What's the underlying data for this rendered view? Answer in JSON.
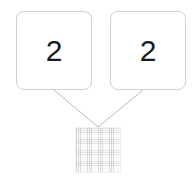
{
  "diagram": {
    "type": "number-bond",
    "background_color": "#ffffff",
    "line_color": "#b9b9b9",
    "box_border_color": "#cfcfcf",
    "digit_color": "#1a1a1a",
    "hatch_color": "#d6d6d6",
    "addends": [
      {
        "label": "2",
        "name": "left-addend"
      },
      {
        "label": "2",
        "name": "right-addend"
      }
    ],
    "sum": {
      "label": "",
      "state": "empty-hatched",
      "name": "sum-slot"
    },
    "connectors": [
      {
        "name": "left-connector",
        "from": "left-addend",
        "to": "sum-slot",
        "x1": 54,
        "y1": 90,
        "x2": 98,
        "y2": 127
      },
      {
        "name": "right-connector",
        "from": "right-addend",
        "to": "sum-slot",
        "x1": 143,
        "y1": 90,
        "x2": 98,
        "y2": 127
      }
    ]
  }
}
